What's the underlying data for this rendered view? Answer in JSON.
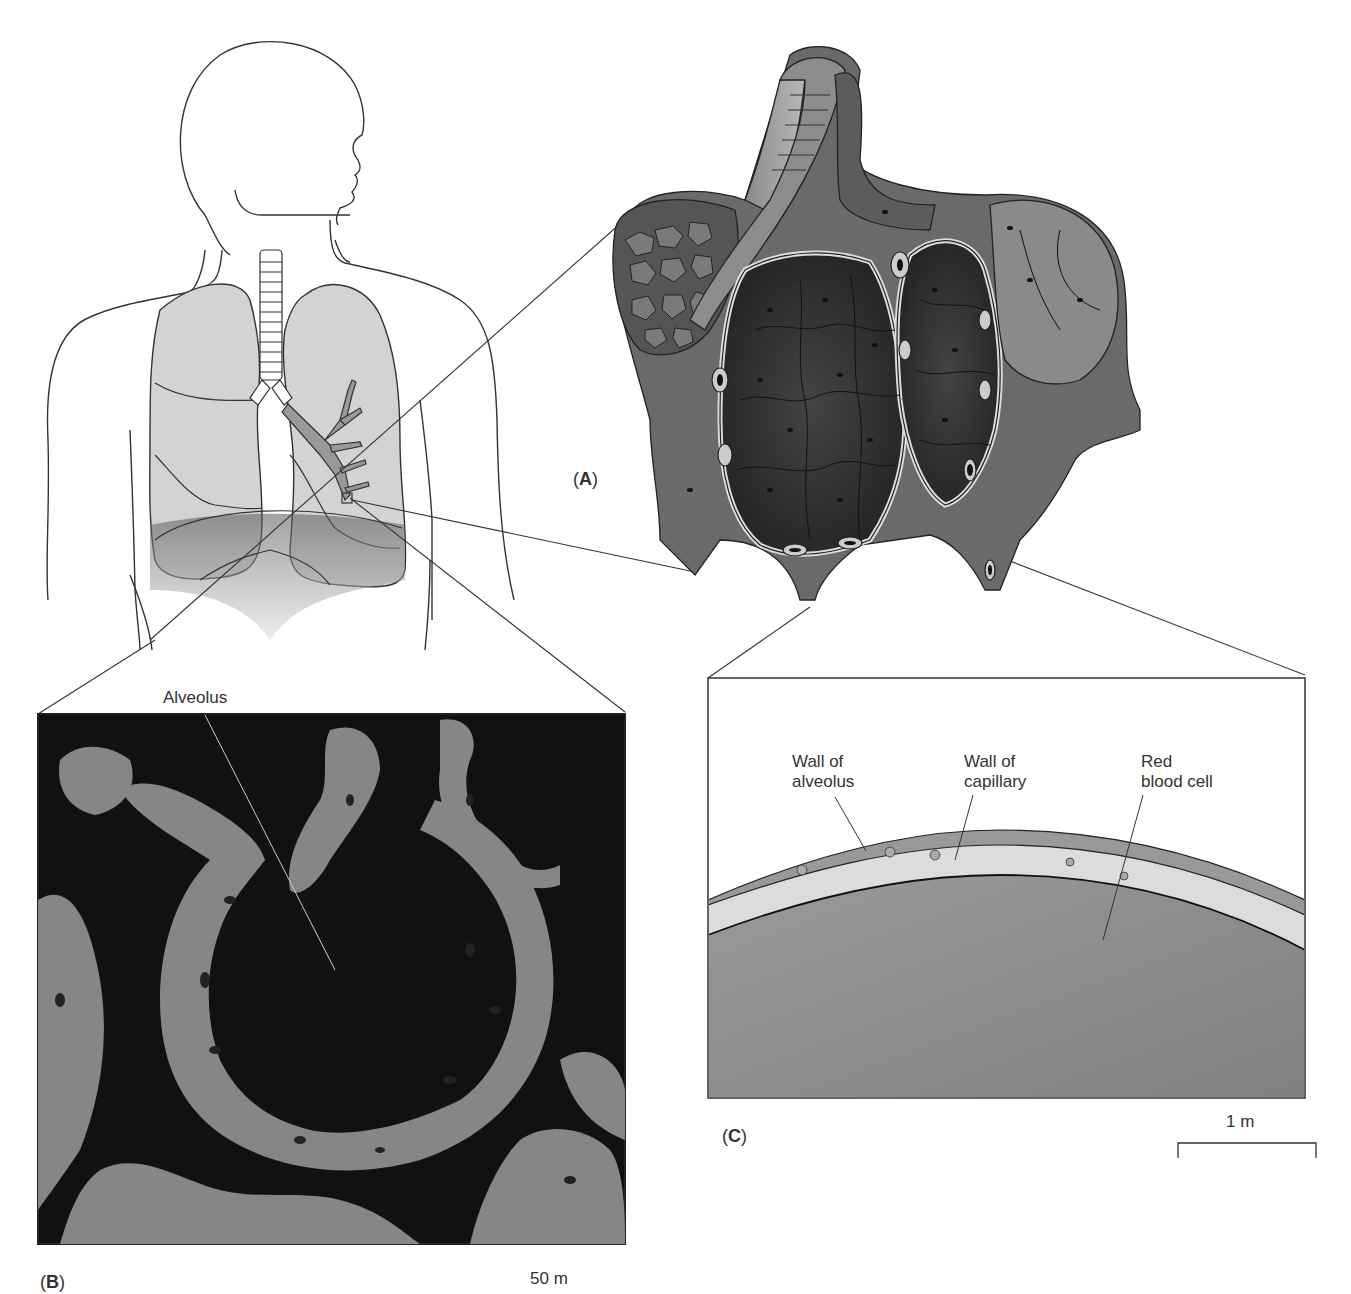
{
  "figure": {
    "panels": [
      {
        "id": "A",
        "label": "(A)",
        "description": "Human torso with lungs and bronchial tree; cutaway 3D drawing of alveoli with capillaries"
      },
      {
        "id": "B",
        "label": "(B)",
        "description": "Scanning micrograph-style drawing of lung tissue showing an alveolus",
        "scale_bar": "50 m"
      },
      {
        "id": "C",
        "label": "(C)",
        "description": "Cross section of alveolus wall, capillary wall and red blood cell",
        "scale_bar": "1 m"
      }
    ],
    "labels": {
      "alveolus": "Alveolus",
      "wall_of_alveolus": "Wall of\nalveolus",
      "wall_of_capillary": "Wall of\ncapillary",
      "red_blood_cell": "Red\nblood cell"
    },
    "panel_a": {
      "prefix": "(",
      "letter": "A",
      "suffix": ")"
    },
    "panel_b": {
      "prefix": "(",
      "letter": "B",
      "suffix": ")",
      "scale": "50 m"
    },
    "panel_c": {
      "prefix": "(",
      "letter": "C",
      "suffix": ")",
      "scale": "1 m"
    },
    "colors": {
      "line": "#333333",
      "lung_fill": "#d4d4d4",
      "tissue_dark": "#3a3a3a",
      "tissue_mid": "#6e6e6e",
      "tissue_light": "#9a9a9a",
      "micrograph_bg": "#111111",
      "rbc_fill": "#8a8a8a"
    }
  }
}
